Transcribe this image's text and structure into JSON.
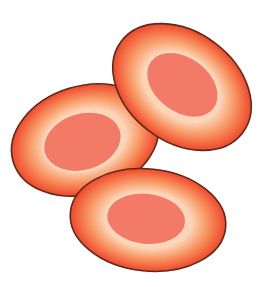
{
  "image": {
    "subject": "three oval nucleated red blood cells",
    "background": "#ffffff",
    "colors": {
      "outline": "#5a2a1a",
      "rim": "#f04a2a",
      "mid": "#f79a66",
      "halo": "#fcd8bc",
      "nucleus": "#f27a66"
    },
    "cells": [
      {
        "name": "left-cell",
        "cx": 85,
        "cy": 140,
        "rx": 75,
        "ry": 54,
        "rotate": -17,
        "ncx": 82,
        "ncy": 141,
        "nrx": 39,
        "nry": 28
      },
      {
        "name": "top-right-cell",
        "cx": 182,
        "cy": 87,
        "rx": 76,
        "ry": 55,
        "rotate": 37,
        "ncx": 181,
        "ncy": 85,
        "nrx": 39,
        "nry": 27
      },
      {
        "name": "bottom-cell",
        "cx": 148,
        "cy": 220,
        "rx": 78,
        "ry": 51,
        "rotate": 6,
        "ncx": 146,
        "ncy": 219,
        "nrx": 39,
        "nry": 25
      }
    ]
  }
}
